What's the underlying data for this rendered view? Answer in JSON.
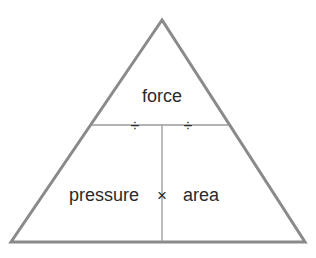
{
  "diagram": {
    "top": {
      "label": "force"
    },
    "bottom_left": {
      "label": "pressure"
    },
    "bottom_right": {
      "label": "area"
    },
    "operators": {
      "divide_left": "÷",
      "divide_right": "÷",
      "multiply": "×"
    },
    "colors": {
      "outline": "#8a8a8a",
      "divider": "#9a9a9a",
      "text": "#2a2a2a",
      "background": "#ffffff"
    }
  }
}
